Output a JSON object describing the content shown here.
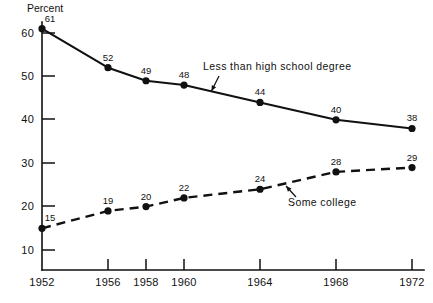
{
  "chart_data": {
    "type": "line",
    "title": "",
    "xlabel": "",
    "ylabel": "Percent",
    "ylim": [
      10,
      62
    ],
    "yticks": [
      10,
      20,
      30,
      40,
      50,
      60
    ],
    "ytick_labels": [
      "10",
      "20",
      "30",
      "40",
      "50",
      "60"
    ],
    "x": [
      1952,
      1956,
      1958,
      1960,
      1964,
      1968,
      1972
    ],
    "xtick_labels": [
      "1952",
      "1956",
      "1958",
      "1960",
      "1964",
      "1968",
      "1972"
    ],
    "xlim": [
      1952,
      1972
    ],
    "grid": false,
    "legend_position": "inline-annotations",
    "series": [
      {
        "name": "Less than high school degree",
        "style": "solid",
        "marker": "filled-circle",
        "values": [
          61,
          52,
          49,
          48,
          44,
          40,
          38
        ],
        "point_labels": [
          "61",
          "52",
          "49",
          "48",
          "44",
          "40",
          "38"
        ],
        "annotation": {
          "text": "Less than high school degree",
          "text_x": 203,
          "text_y": 70,
          "arrow_from_x": 219,
          "arrow_from_y": 76,
          "arrow_to_x": 211.5,
          "arrow_to_y": 91
        }
      },
      {
        "name": "Some college",
        "style": "dashed",
        "marker": "filled-circle",
        "values": [
          15,
          19,
          20,
          22,
          24,
          28,
          29
        ],
        "point_labels": [
          "15",
          "19",
          "20",
          "22",
          "24",
          "28",
          "29"
        ],
        "annotation": {
          "text": "Some college",
          "text_x": 288,
          "text_y": 206,
          "arrow_from_x": 296,
          "arrow_from_y": 197,
          "arrow_to_x": 286,
          "arrow_to_y": 186
        }
      }
    ]
  },
  "axes": {
    "y_axis_title": "Percent",
    "y_axis_title_x": 27,
    "y_axis_title_y": 12,
    "plot_left": 42,
    "plot_bottom": 270,
    "plot_right": 424,
    "plot_top": 22
  },
  "y_ticks": [
    {
      "label": "60",
      "y": 33,
      "label_x": 34
    },
    {
      "label": "50",
      "y": 76,
      "label_x": 34
    },
    {
      "label": "40",
      "y": 119,
      "label_x": 34
    },
    {
      "label": "30",
      "y": 163,
      "label_x": 34
    },
    {
      "label": "20",
      "y": 206,
      "label_x": 34
    },
    {
      "label": "10",
      "y": 250,
      "label_x": 34
    }
  ],
  "x_ticks": [
    {
      "label": "1952",
      "x": 42,
      "show_mark": false
    },
    {
      "label": "1956",
      "x": 108,
      "show_mark": true
    },
    {
      "label": "1958",
      "x": 146,
      "show_mark": true
    },
    {
      "label": "1960",
      "x": 184,
      "show_mark": true
    },
    {
      "label": "1964",
      "x": 260,
      "show_mark": true
    },
    {
      "label": "1968",
      "x": 336,
      "show_mark": true
    },
    {
      "label": "1972",
      "x": 412,
      "show_mark": true
    }
  ]
}
